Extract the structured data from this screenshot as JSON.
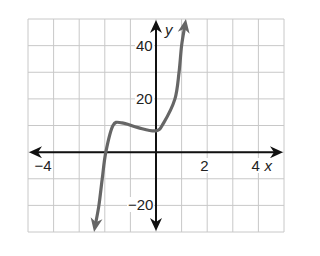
{
  "chart_data": {
    "type": "line",
    "title": "",
    "xlabel": "x",
    "ylabel": "y",
    "xlim": [
      -5,
      5
    ],
    "ylim": [
      -30,
      50
    ],
    "x_grid_step": 1,
    "y_grid_step": 10,
    "grid": true,
    "legend": null,
    "x_tick_labels": [
      {
        "value": -4,
        "label": "−4"
      },
      {
        "value": 2,
        "label": "2"
      },
      {
        "value": 4,
        "label": "4"
      }
    ],
    "y_tick_labels": [
      {
        "value": 40,
        "label": "40"
      },
      {
        "value": 20,
        "label": "20"
      },
      {
        "value": -20,
        "label": "−20"
      }
    ],
    "series": [
      {
        "name": "f(x)",
        "color": "#666666",
        "arrows_both_ends": true,
        "points": [
          {
            "x": -2.42,
            "y": -30
          },
          {
            "x": -2.23,
            "y": -20
          },
          {
            "x": -2.1,
            "y": -10
          },
          {
            "x": -1.96,
            "y": 0
          },
          {
            "x": -1.68,
            "y": 10
          },
          {
            "x": -1.33,
            "y": 11
          },
          {
            "x": -0.7,
            "y": 9.2
          },
          {
            "x": 0,
            "y": 8
          },
          {
            "x": 0.3,
            "y": 11
          },
          {
            "x": 0.74,
            "y": 20
          },
          {
            "x": 0.9,
            "y": 30
          },
          {
            "x": 1.0,
            "y": 40
          },
          {
            "x": 1.17,
            "y": 50
          }
        ]
      }
    ],
    "features": {
      "x_intercept": -2,
      "local_max": {
        "x": -1.33,
        "y": 11
      },
      "local_min": {
        "x": 0,
        "y": 8
      },
      "y_intercept": 8
    }
  },
  "colors": {
    "grid": "#c8c8c8",
    "axes": "#111111",
    "curve": "#666666"
  }
}
